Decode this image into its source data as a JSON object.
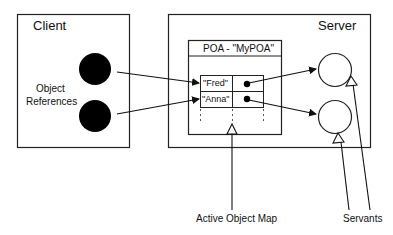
{
  "client": {
    "title": "Client",
    "object_references_label_line1": "Object",
    "object_references_label_line2": "References"
  },
  "server": {
    "title": "Server",
    "poa": {
      "title": "POA - \"MyPOA\"",
      "active_object_map": {
        "rows": [
          {
            "object_id": "\"Fred\""
          },
          {
            "object_id": "\"Anna\""
          }
        ]
      }
    }
  },
  "annotations": {
    "active_object_map": "Active Object Map",
    "servants": "Servants"
  }
}
